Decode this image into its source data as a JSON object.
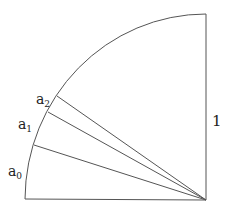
{
  "diagram": {
    "type": "quarter-circle-sector",
    "center": [
      206,
      200
    ],
    "radius_x": 181,
    "radius_y": 186,
    "side_label": "1",
    "points": [
      {
        "name": "a0",
        "label_base": "a",
        "label_sub": "0",
        "arc_point": [
          34,
          145
        ],
        "label_pos": [
          8,
          176
        ]
      },
      {
        "name": "a1",
        "label_base": "a",
        "label_sub": "1",
        "arc_point": [
          48,
          112
        ],
        "label_pos": [
          18,
          129
        ]
      },
      {
        "name": "a2",
        "label_base": "a",
        "label_sub": "2",
        "arc_point": [
          57,
          96
        ],
        "label_pos": [
          36,
          104
        ]
      }
    ],
    "stroke_color": "#555555"
  }
}
